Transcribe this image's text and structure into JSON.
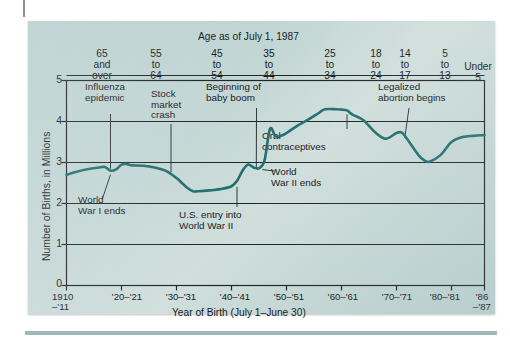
{
  "figure": {
    "accent_color": "#1d6b6b",
    "panel_color": "#c0d4d2",
    "axis_color": "#1a1f24"
  },
  "chart_data": {
    "type": "line",
    "title": "",
    "xlabel": "Year of Birth (July 1–June 30)",
    "ylabel": "Number of Births, in Millions",
    "top_axis_label": "Age as of July 1, 1987",
    "xlim": [
      1910,
      1986
    ],
    "ylim": [
      0,
      5
    ],
    "ytick_labels": [
      "5",
      "4",
      "3",
      "2",
      "1",
      "0"
    ],
    "ytick_values": [
      5,
      4,
      3,
      2,
      1,
      0
    ],
    "grid": true,
    "legend": "none",
    "xtick_labels": [
      "1910\n–'11",
      "'20–'21",
      "'30–'31",
      "'40–'41",
      "'50–'51",
      "'60–'61",
      "'70–'71",
      "'80–'81",
      "'86\n–'87"
    ],
    "xtick_values": [
      1910,
      1920,
      1930,
      1940,
      1950,
      1960,
      1970,
      1980,
      1986
    ],
    "top_axis_groups": [
      {
        "label": "65\nand\nover",
        "x": 1913
      },
      {
        "label": "55\nto\n64",
        "x": 1925
      },
      {
        "label": "45\nto\n54",
        "x": 1937
      },
      {
        "label": "35\nto\n44",
        "x": 1947
      },
      {
        "label": "25\nto\n34",
        "x": 1957.5
      },
      {
        "label": "18\nto\n24",
        "x": 1966
      },
      {
        "label": "14\nto\n17",
        "x": 1971
      },
      {
        "label": "5\nto\n13",
        "x": 1978
      },
      {
        "label": "Under\n5",
        "x": 1984
      }
    ],
    "series": [
      {
        "name": "Births",
        "x": [
          1910,
          1912,
          1914,
          1916,
          1917,
          1918,
          1919,
          1920,
          1921,
          1922,
          1924,
          1926,
          1928,
          1930,
          1931,
          1932,
          1933,
          1934,
          1936,
          1938,
          1940,
          1941,
          1942,
          1943,
          1944,
          1945,
          1946,
          1947,
          1948,
          1949,
          1950,
          1952,
          1954,
          1956,
          1957,
          1959,
          1960,
          1961,
          1962,
          1964,
          1966,
          1968,
          1970,
          1971,
          1972,
          1974,
          1975,
          1976,
          1978,
          1980,
          1982,
          1984,
          1986
        ],
        "y": [
          2.7,
          2.78,
          2.84,
          2.88,
          2.89,
          2.8,
          2.83,
          2.95,
          2.96,
          2.93,
          2.92,
          2.88,
          2.8,
          2.62,
          2.5,
          2.38,
          2.3,
          2.3,
          2.32,
          2.35,
          2.42,
          2.55,
          2.8,
          2.95,
          2.88,
          2.86,
          3.05,
          3.82,
          3.64,
          3.65,
          3.72,
          3.9,
          4.05,
          4.22,
          4.3,
          4.3,
          4.29,
          4.27,
          4.17,
          4.03,
          3.75,
          3.58,
          3.72,
          3.73,
          3.56,
          3.18,
          3.06,
          3.02,
          3.18,
          3.5,
          3.62,
          3.65,
          3.67
        ],
        "color": "#1d6b6b"
      }
    ],
    "annotations": [
      {
        "name": "influenza-epidemic",
        "label": "Influenza\nepidemic",
        "x": 1918,
        "y": 2.8
      },
      {
        "name": "stock-market-crash",
        "label": "Stock\nmarket\ncrash",
        "x": 1929,
        "y": 2.72
      },
      {
        "name": "beginning-of-baby-boom",
        "label": "Beginning of\nbaby boom",
        "x": 1946,
        "y": 3.05
      },
      {
        "name": "legalized-abortion-begins",
        "label": "Legalized\nabortion begins",
        "x": 1973,
        "y": 3.5
      },
      {
        "name": "oral-contraceptives",
        "label": "Oral\ncontraceptives",
        "x": 1961,
        "y": 4.25
      },
      {
        "name": "world-war-i-ends",
        "label": "World\nWar I ends",
        "x": 1918,
        "y": 2.8
      },
      {
        "name": "us-entry-into-world-war-ii",
        "label": "U.S. entry into\nWorld War II",
        "x": 1941,
        "y": 2.55
      },
      {
        "name": "world-war-ii-ends",
        "label": "World\nWar II ends",
        "x": 1945,
        "y": 2.86
      }
    ]
  }
}
